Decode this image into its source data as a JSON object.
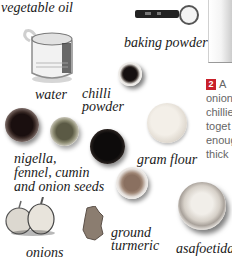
{
  "ingredients": {
    "vegetable_oil": "vegetable oil",
    "water": "water",
    "baking_powder": "baking powder",
    "chilli_powder": "chilli\npowder",
    "seeds": "nigella,\nfennel, cumin\nand onion seeds",
    "gram_flour": "gram flour",
    "onions": "onions",
    "ground_turmeric": "ground\nturmeric",
    "asafoetida": "asafoetida"
  },
  "step": {
    "number": "2",
    "first_word": "A",
    "lines": [
      "onion",
      "chillie",
      "toget",
      "enoug",
      "thick"
    ]
  },
  "colors": {
    "step_badge": "#c9202a",
    "step_text": "#666666",
    "label_text": "#1a1a1a"
  }
}
